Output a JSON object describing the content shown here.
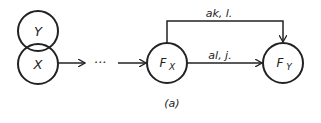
{
  "diagram": {
    "nodes": [
      {
        "id": "Y",
        "label": "Y"
      },
      {
        "id": "X",
        "label": "X"
      },
      {
        "id": "Fx",
        "label": "F",
        "sub": "X"
      },
      {
        "id": "Fy",
        "label": "F",
        "sub": "Y"
      }
    ],
    "ellipsis": "···",
    "edges": [
      {
        "from": "X",
        "to": "...",
        "label": ""
      },
      {
        "from": "...",
        "to": "Fx",
        "label": ""
      },
      {
        "from": "Fx",
        "to": "Fy",
        "label": "al, j."
      },
      {
        "from": "Fx",
        "to": "Fy",
        "label": "ak, l.",
        "route": "over"
      }
    ],
    "caption": "(a)"
  }
}
